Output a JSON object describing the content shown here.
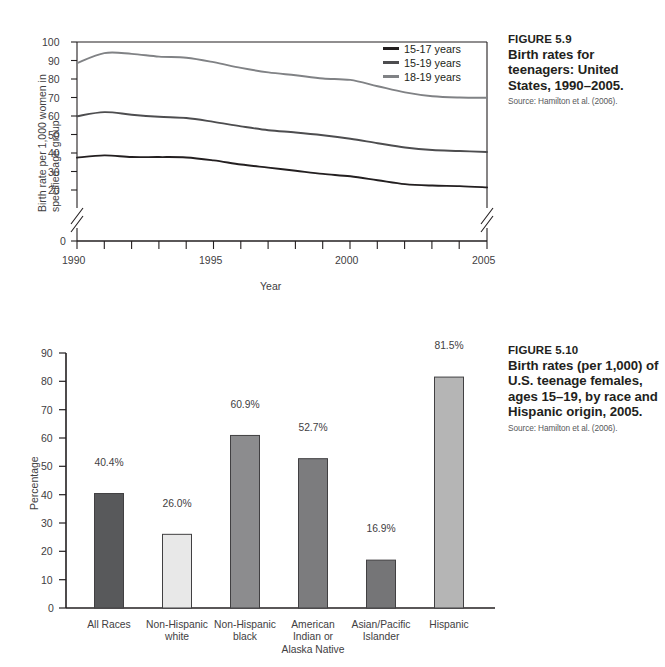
{
  "figure_line": {
    "caption": {
      "figure_number": "FIGURE 5.9",
      "title": "Birth rates for teenagers: United States, 1990–2005.",
      "source": "Source: Hamilton et al. (2006)."
    }
  },
  "figure_bar": {
    "caption": {
      "figure_number": "FIGURE 5.10",
      "title": "Birth rates (per 1,000) of U.S. teenage females, ages 15–19, by race and Hispanic origin, 2005.",
      "source": "Source: Hamilton et al. (2006)."
    }
  },
  "chart_data": [
    {
      "type": "line",
      "title": "Birth rates for teenagers: United States, 1990–2005.",
      "xlabel": "Year",
      "ylabel": "Birth rate per 1,000 women in specified age group",
      "xlim": [
        1990,
        2005
      ],
      "ylim": [
        0,
        100
      ],
      "y_axis_break": true,
      "y_break_between": [
        0,
        20
      ],
      "grid": false,
      "legend_position": "top-right",
      "xticks": [
        1990,
        1995,
        2000,
        2005
      ],
      "xtick_labels": [
        "1990",
        "1995",
        "2000",
        "2005"
      ],
      "yticks": [
        0,
        20,
        30,
        40,
        50,
        60,
        70,
        80,
        90,
        100
      ],
      "ytick_labels": [
        "0",
        "20",
        "30",
        "40",
        "50",
        "60",
        "70",
        "80",
        "90",
        "100"
      ],
      "x": [
        1990,
        1991,
        1992,
        1993,
        1994,
        1995,
        1996,
        1997,
        1998,
        1999,
        2000,
        2001,
        2002,
        2003,
        2004,
        2005
      ],
      "series": [
        {
          "name": "15-17 years",
          "color": "#231f20",
          "values": [
            37.5,
            38.7,
            37.8,
            37.8,
            37.6,
            36.0,
            33.8,
            32.1,
            30.4,
            28.7,
            27.4,
            25.3,
            23.2,
            22.4,
            22.1,
            21.4
          ]
        },
        {
          "name": "15-19 years",
          "color": "#4d4d4f",
          "values": [
            59.9,
            62.1,
            60.7,
            59.6,
            58.9,
            56.8,
            54.4,
            52.3,
            51.1,
            49.6,
            47.7,
            45.3,
            43.0,
            41.6,
            41.1,
            40.5
          ]
        },
        {
          "name": "18-19 years",
          "color": "#808285",
          "values": [
            88.6,
            94.0,
            93.6,
            92.1,
            91.5,
            89.1,
            86.0,
            83.6,
            82.0,
            80.3,
            79.5,
            76.1,
            72.8,
            70.7,
            70.0,
            69.9
          ]
        }
      ]
    },
    {
      "type": "bar",
      "title": "Birth rates (per 1,000) of U.S. teenage females, ages 15–19, by race and Hispanic origin, 2005.",
      "xlabel": "",
      "ylabel": "Percentage",
      "ylim": [
        0,
        90
      ],
      "grid": false,
      "yticks": [
        0,
        10,
        20,
        30,
        40,
        50,
        60,
        70,
        80,
        90
      ],
      "ytick_labels": [
        "0",
        "10",
        "20",
        "30",
        "40",
        "50",
        "60",
        "70",
        "80",
        "90"
      ],
      "categories": [
        "All Races",
        "Non-Hispanic\nwhite",
        "Non-Hispanic\nblack",
        "American\nIndian or\nAlaska Native",
        "Asian/Pacific\nIslander",
        "Hispanic"
      ],
      "values": [
        40.4,
        26.0,
        60.9,
        52.7,
        16.9,
        81.5
      ],
      "value_labels": [
        "40.4%",
        "26.0%",
        "60.9%",
        "52.7%",
        "16.9%",
        "81.5%"
      ],
      "bar_colors": [
        "#58595b",
        "#e8e8e8",
        "#8c8c8e",
        "#7c7c7e",
        "#757577",
        "#b5b5b5"
      ]
    }
  ]
}
